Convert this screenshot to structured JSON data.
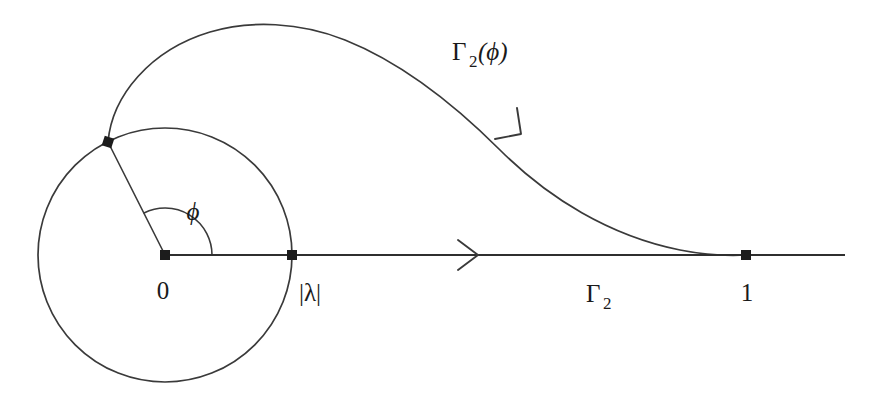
{
  "figure": {
    "background_color": "#ffffff",
    "stroke_color": "#3a3a3a",
    "labels": {
      "origin": "0",
      "lambda_modulus": "|λ|",
      "unit_point": "1",
      "angle": "ϕ",
      "contour_gamma2": "Γ",
      "contour_gamma2_sub": "2",
      "contour_deformed_head": "Γ",
      "contour_deformed_sub": "2",
      "contour_deformed_tail": "(ϕ)"
    },
    "geometry": {
      "circle_center": [
        165,
        255
      ],
      "circle_radius": 127,
      "origin_point": [
        165,
        255
      ],
      "lambda_point": [
        292,
        255
      ],
      "unit_point": [
        746,
        255
      ],
      "node_point": [
        108,
        142
      ],
      "axis_start_x": 165,
      "axis_end_x": 845,
      "axis_y": 255,
      "angle_degrees": 135,
      "angle_arc_radius": 47,
      "apex_point": [
        290,
        26
      ]
    },
    "label_positions": {
      "origin": [
        163,
        292
      ],
      "lambda_modulus": [
        310,
        294
      ],
      "unit_point": [
        746,
        294
      ],
      "angle": [
        193,
        212
      ],
      "gamma2": [
        600,
        295
      ],
      "gamma2_phi": [
        510,
        52
      ]
    },
    "arrows": [
      {
        "name": "axis-direction-arrow",
        "at": [
          470,
          255
        ],
        "angle": 0
      },
      {
        "name": "contour-direction-arrow",
        "at": [
          518,
          133
        ],
        "angle": 52
      }
    ]
  }
}
